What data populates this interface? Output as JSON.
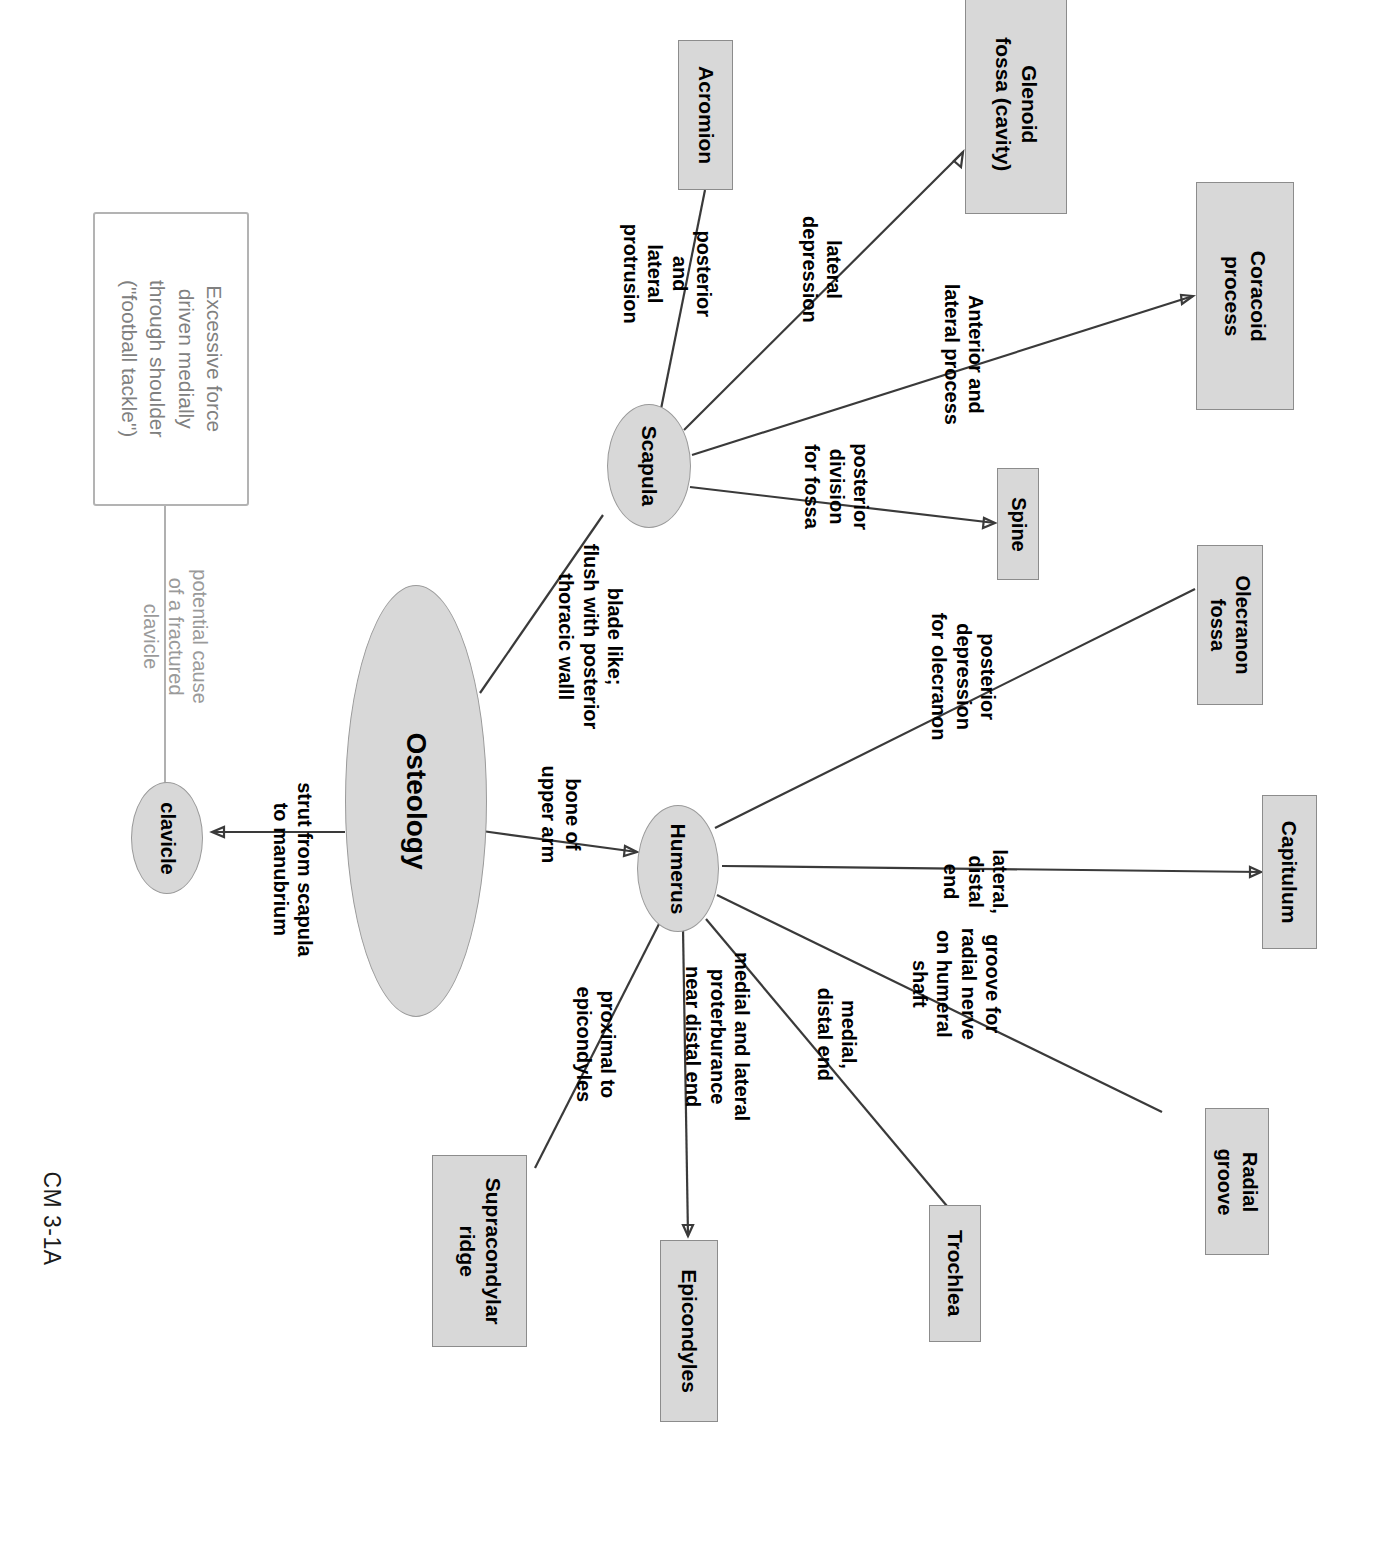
{
  "page": {
    "corner_label": "CM 3-1A",
    "colors": {
      "node_fill": "#d8d8d8",
      "node_border": "#8c8c8c",
      "text": "#000000",
      "muted_text": "#808080",
      "link": "#3a3a3a"
    }
  },
  "diagram": {
    "type": "concept-map",
    "root": "Osteology",
    "nodes": [
      {
        "id": "osteology",
        "label": "Osteology",
        "shape": "ellipse"
      },
      {
        "id": "clavicle",
        "label": "clavicle",
        "shape": "ellipse"
      },
      {
        "id": "scapula",
        "label": "Scapula",
        "shape": "ellipse"
      },
      {
        "id": "humerus",
        "label": "Humerus",
        "shape": "ellipse"
      },
      {
        "id": "acromion",
        "label": "Acromion",
        "shape": "box"
      },
      {
        "id": "glenoid",
        "label": "Glenoid\nfossa (cavity)",
        "shape": "box"
      },
      {
        "id": "coracoid",
        "label": "Coracoid\nprocess",
        "shape": "box"
      },
      {
        "id": "spine",
        "label": "Spine",
        "shape": "box"
      },
      {
        "id": "olecranon-fossa",
        "label": "Olecranon\nfossa",
        "shape": "box"
      },
      {
        "id": "capitulum",
        "label": "Capitulum",
        "shape": "box"
      },
      {
        "id": "radial-groove",
        "label": "Radial\ngroove",
        "shape": "box"
      },
      {
        "id": "trochlea",
        "label": "Trochlea",
        "shape": "box"
      },
      {
        "id": "epicondyles",
        "label": "Epicondyles",
        "shape": "box"
      },
      {
        "id": "supracondylar",
        "label": "Supracondylar\nridge",
        "shape": "box"
      },
      {
        "id": "note-force",
        "label": "Excessive force\ndriven medially\nthrough shoulder\n(\"football tackle\")",
        "shape": "note"
      }
    ],
    "edges": [
      {
        "from": "osteology",
        "to": "clavicle",
        "label": "strut from scapula\nto manubrium"
      },
      {
        "from": "osteology",
        "to": "scapula",
        "label": "blade like;\nflush with posterior\nthoracic walll"
      },
      {
        "from": "osteology",
        "to": "humerus",
        "label": "bone of\nupper arm"
      },
      {
        "from": "clavicle",
        "to": "note-force",
        "label": "potential cause\nof a fractured\nclavicle",
        "style": "muted"
      },
      {
        "from": "scapula",
        "to": "acromion",
        "label": "posterior\nand\nlateral\nprotrusion"
      },
      {
        "from": "scapula",
        "to": "glenoid",
        "label": "lateral\ndepression"
      },
      {
        "from": "scapula",
        "to": "coracoid",
        "label": "Anterior and\nlateral process"
      },
      {
        "from": "scapula",
        "to": "spine",
        "label": "posterior\ndivision\nfor fossa"
      },
      {
        "from": "humerus",
        "to": "olecranon-fossa",
        "label": "posterior\ndepression\nfor olecranon"
      },
      {
        "from": "humerus",
        "to": "capitulum",
        "label": "lateral,\ndistal\nend"
      },
      {
        "from": "humerus",
        "to": "radial-groove",
        "label": "groove for\nradial nerve\non humeral\nshaft"
      },
      {
        "from": "humerus",
        "to": "trochlea",
        "label": "medial,\ndistal end"
      },
      {
        "from": "humerus",
        "to": "epicondyles",
        "label": "medial and lateral\nproterburance\nnear distal end"
      },
      {
        "from": "humerus",
        "to": "supracondylar",
        "label": "proximal to\nepicondyles"
      }
    ]
  },
  "labels": {
    "osteology": "Osteology",
    "clavicle": "clavicle",
    "scapula": "Scapula",
    "humerus": "Humerus",
    "acromion": "Acromion",
    "glenoid_line1": "Glenoid",
    "glenoid_line2": "fossa (cavity)",
    "coracoid_line1": "Coracoid",
    "coracoid_line2": "process",
    "spine": "Spine",
    "olecranon_line1": "Olecranon",
    "olecranon_line2": "fossa",
    "capitulum": "Capitulum",
    "radial_line1": "Radial",
    "radial_line2": "groove",
    "trochlea": "Trochlea",
    "epicondyles": "Epicondyles",
    "supracondylar_line1": "Supracondylar",
    "supracondylar_line2": "ridge",
    "note_force": "Excessive force\ndriven medially\nthrough shoulder\n(\"football tackle\")",
    "e_strut": "strut from scapula\nto manubrium",
    "e_blade": "blade like;\nflush with posterior\nthoracic walll",
    "e_bone": "bone of\nupper arm",
    "e_potential": "potential cause\nof a fractured\nclavicle",
    "e_protrusion": "posterior\nand\nlateral\nprotrusion",
    "e_lateral_depression": "lateral\ndepression",
    "e_anterior_lateral": "Anterior and\nlateral process",
    "e_post_division": "posterior\ndivision\nfor fossa",
    "e_post_depression": "posterior\ndepression\nfor olecranon",
    "e_lateral_distal": "lateral,\ndistal\nend",
    "e_groove_radial": "groove for\nradial nerve\non humeral\nshaft",
    "e_medial_distal": "medial,\ndistal end",
    "e_medial_lateral_prot": "medial and lateral\nproterburance\nnear distal end",
    "e_proximal_epi": "proximal to\nepicondyles"
  }
}
